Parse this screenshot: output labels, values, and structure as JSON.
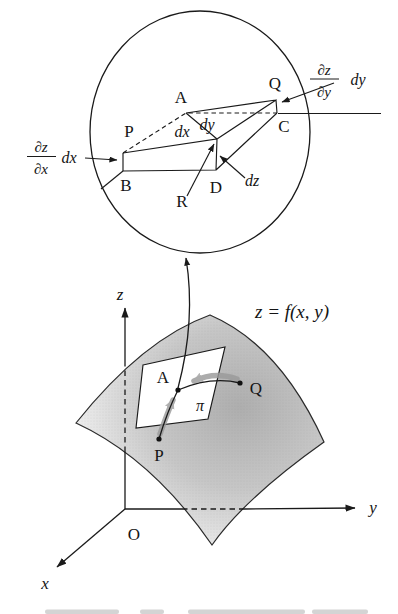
{
  "magnifier": {
    "labels": {
      "A": "A",
      "B": "B",
      "C": "C",
      "D": "D",
      "P": "P",
      "Q": "Q",
      "R": "R"
    },
    "differentials": {
      "dx": "dx",
      "dy": "dy",
      "dz": "dz"
    },
    "partial_x": {
      "numerator": "∂z",
      "denominator": "∂x",
      "multiplier": "dx"
    },
    "partial_y": {
      "numerator": "∂z",
      "denominator": "∂y",
      "multiplier": "dy"
    }
  },
  "plot": {
    "axes": {
      "x": "x",
      "y": "y",
      "z": "z",
      "origin": "O"
    },
    "equation": "z = f(x, y)",
    "points": {
      "A": "A",
      "P": "P",
      "Q": "Q"
    },
    "plane": "π"
  },
  "colors": {
    "ink": "#1a1a1a",
    "surface_dark": "#b0b0b0",
    "surface_light": "#f8f8f8",
    "grey_arrow": "#9a9a9a"
  }
}
